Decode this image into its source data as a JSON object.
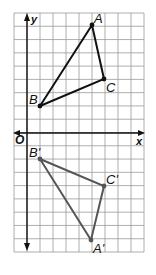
{
  "diagram": {
    "type": "coordinate-plane-reflection",
    "grid": {
      "x_min": -1,
      "x_max": 9,
      "y_min": -9,
      "y_max": 9,
      "cell_px": 13.1,
      "origin_px": [
        27,
        133
      ],
      "left_px": 14,
      "top_px": 13,
      "right_px": 144,
      "bottom_px": 252,
      "line_color": "#9a9a9a"
    },
    "axes": {
      "x_label": "x",
      "y_label": "y",
      "origin_label": "O",
      "color": "#111111"
    },
    "triangles": [
      {
        "name": "ABC",
        "color": "#111111",
        "vertices": [
          {
            "label": "A",
            "x": 5,
            "y": 8
          },
          {
            "label": "B",
            "x": 1,
            "y": 2
          },
          {
            "label": "C",
            "x": 6,
            "y": 4
          }
        ]
      },
      {
        "name": "A'B'C'",
        "color": "#555555",
        "vertices": [
          {
            "label": "A'",
            "x": 5,
            "y": -8
          },
          {
            "label": "B'",
            "x": 1,
            "y": -2
          },
          {
            "label": "C'",
            "x": 6,
            "y": -4
          }
        ]
      }
    ]
  },
  "labels": {
    "A": "A",
    "B": "B",
    "C": "C",
    "A_prime": "A'",
    "B_prime": "B'",
    "C_prime": "C'",
    "x": "x",
    "y": "y",
    "O": "O"
  }
}
